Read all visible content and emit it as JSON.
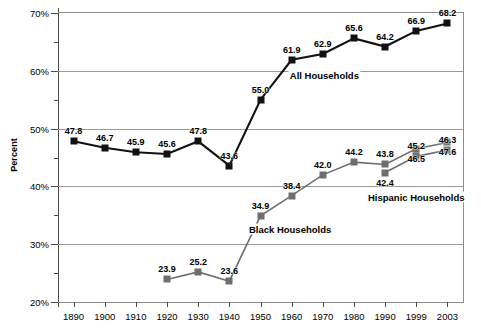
{
  "chart_data": {
    "type": "line",
    "title": "",
    "xlabel": "",
    "ylabel": "Percent",
    "ylim": [
      20,
      70
    ],
    "ytick_labels": [
      "20%",
      "30%",
      "40%",
      "50%",
      "60%",
      "70%"
    ],
    "ytick_values": [
      20,
      30,
      40,
      50,
      60,
      70
    ],
    "yminor_values": [
      25,
      35,
      45,
      55,
      65
    ],
    "grid": "horizontal",
    "legend": "inline-annotations",
    "categories": [
      "1890",
      "1900",
      "1910",
      "1920",
      "1930",
      "1940",
      "1950",
      "1960",
      "1970",
      "1980",
      "1990",
      "1999",
      "2003"
    ],
    "series": [
      {
        "name": "All Households",
        "color": "#111111",
        "marker": "square",
        "values": [
          47.8,
          46.7,
          45.9,
          45.6,
          47.8,
          43.6,
          55.0,
          61.9,
          62.9,
          65.6,
          64.2,
          66.9,
          68.2
        ],
        "labels": [
          "47.8",
          "46.7",
          "45.9",
          "45.6",
          "47.8",
          "43.6",
          "55.0",
          "61.9",
          "62.9",
          "65.6",
          "64.2",
          "66.9",
          "68.2"
        ]
      },
      {
        "name": "Black Households",
        "color": "#6e6e6e",
        "marker": "square",
        "values": [
          null,
          null,
          null,
          23.9,
          25.2,
          23.6,
          34.9,
          38.4,
          42.0,
          44.2,
          43.8,
          46.5,
          47.6
        ],
        "labels": [
          null,
          null,
          null,
          "23.9",
          "25.2",
          "23.6",
          "34.9",
          "38.4",
          "42.0",
          "44.2",
          "43.8",
          "46.5",
          "47.6"
        ]
      },
      {
        "name": "Hispanic Households",
        "color": "#6e6e6e",
        "marker": "square",
        "values": [
          null,
          null,
          null,
          null,
          null,
          null,
          null,
          null,
          null,
          null,
          42.4,
          45.2,
          46.3
        ],
        "labels": [
          null,
          null,
          null,
          null,
          null,
          null,
          null,
          null,
          null,
          null,
          "42.4",
          "45.2",
          "46.3"
        ]
      }
    ],
    "annotations": [
      {
        "text": "All Households",
        "x_index": 8.05,
        "y": 59.3
      },
      {
        "text": "Black Households",
        "x_index": 6.95,
        "y": 32.6
      },
      {
        "text": "Hispanic Households",
        "x_index": 11.0,
        "y": 38.1
      }
    ]
  }
}
